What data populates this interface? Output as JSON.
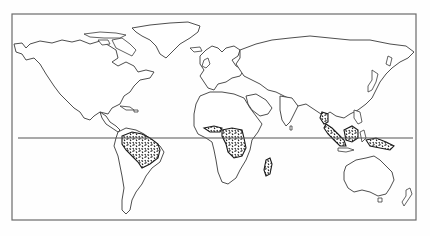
{
  "map": {
    "type": "world-outline",
    "projection": "equirectangular-style",
    "reference_lines": [
      {
        "name": "equator",
        "y": 138
      }
    ],
    "highlighted_regions": [
      {
        "id": "amazon-basin",
        "continent": "South America",
        "style": "stipple"
      },
      {
        "id": "congo-basin",
        "continent": "Africa",
        "style": "stipple"
      },
      {
        "id": "madagascar-east",
        "continent": "Africa",
        "style": "stipple"
      },
      {
        "id": "southeast-asia",
        "continent": "Asia",
        "style": "stipple"
      },
      {
        "id": "new-guinea",
        "continent": "Oceania",
        "style": "stipple"
      }
    ],
    "colors": {
      "outline": "#3a3a3a",
      "frame": "#6a6a6a",
      "stipple": "#1a1a1a",
      "background": "#ffffff"
    },
    "frame": {
      "x": 12,
      "y": 14,
      "width": 404,
      "height": 206
    }
  }
}
